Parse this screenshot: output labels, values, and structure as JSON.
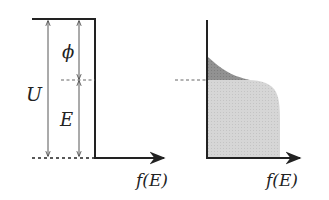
{
  "diagram": {
    "left_panel": {
      "title": "Energy potential well",
      "labels": {
        "U": "U",
        "phi": "ϕ",
        "E": "E",
        "x_axis": "f(E)"
      }
    },
    "right_panel": {
      "title": "Fermi-Dirac distribution",
      "labels": {
        "x_axis": "f(E)"
      }
    },
    "colors": {
      "line": "#222222",
      "dashed": "#555555",
      "fill_light": "#d4d4d4",
      "fill_dark": "#8e8e8e",
      "arrow_thin": "#444444"
    }
  }
}
